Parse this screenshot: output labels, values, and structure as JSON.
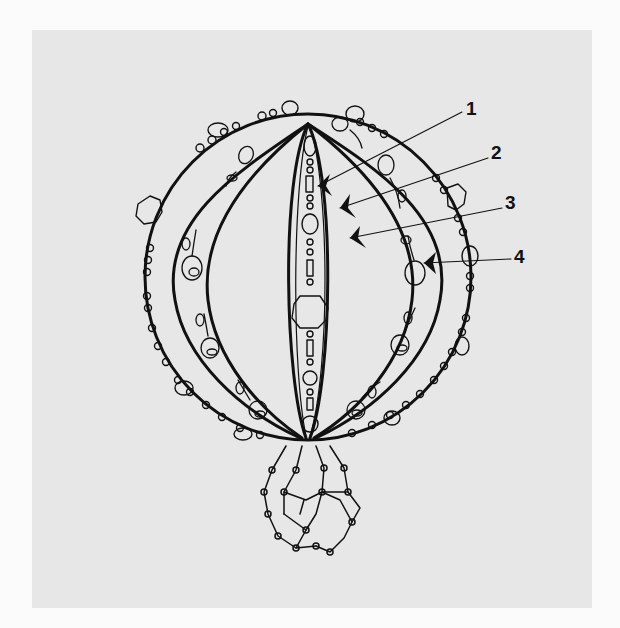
{
  "figure": {
    "background_color": "#fbfbfb",
    "panel_color": "#e7e7e7",
    "line_color": "#111111"
  },
  "callouts": [
    {
      "number": "1",
      "x": 466,
      "y": 100,
      "target_x": 318,
      "target_y": 186
    },
    {
      "number": "2",
      "x": 491,
      "y": 144,
      "target_x": 340,
      "target_y": 208
    },
    {
      "number": "3",
      "x": 505,
      "y": 194,
      "target_x": 350,
      "target_y": 238
    },
    {
      "number": "4",
      "x": 514,
      "y": 248,
      "target_x": 424,
      "target_y": 263
    }
  ]
}
